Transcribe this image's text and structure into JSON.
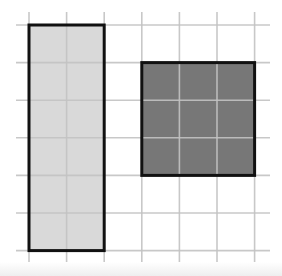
{
  "diagram": {
    "type": "grid-area-comparison",
    "grid": {
      "columns": 7,
      "rows": 7,
      "cell_size_px": 37.6,
      "origin_x": 29,
      "origin_y": 25,
      "line_color": "#c2c2c2",
      "line_extent": {
        "x_min": 16,
        "x_max": 270,
        "y_min": 12,
        "y_max": 262
      }
    },
    "shapes": [
      {
        "name": "light-rectangle",
        "col": 0,
        "row": 0,
        "width_cells": 2,
        "height_cells": 6,
        "area_cells": 12,
        "fill": "#d9d9d9",
        "stroke": "#111111"
      },
      {
        "name": "dark-square",
        "col": 3,
        "row": 1,
        "width_cells": 3,
        "height_cells": 3,
        "area_cells": 9,
        "fill": "#777777",
        "stroke": "#111111"
      }
    ]
  }
}
